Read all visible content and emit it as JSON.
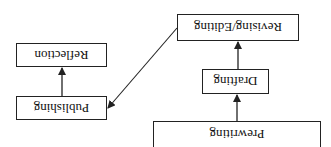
{
  "diagram": {
    "orientation": "rotated-180",
    "nodes": [
      {
        "id": "prewriting",
        "label": "Prewriting",
        "x": 153,
        "y": 121,
        "w": 168,
        "h": 27
      },
      {
        "id": "drafting",
        "label": "Drafting",
        "x": 202,
        "y": 69,
        "w": 67,
        "h": 25
      },
      {
        "id": "revising",
        "label": "Revising/Editing",
        "x": 177,
        "y": 14,
        "w": 122,
        "h": 27
      },
      {
        "id": "publishing",
        "label": "Publishing",
        "x": 16,
        "y": 96,
        "w": 91,
        "h": 24
      },
      {
        "id": "reflection",
        "label": "Reflection",
        "x": 16,
        "y": 43,
        "w": 91,
        "h": 24
      }
    ],
    "edges": [
      {
        "from": "prewriting",
        "to": "drafting"
      },
      {
        "from": "drafting",
        "to": "revising"
      },
      {
        "from": "revising",
        "to": "publishing"
      },
      {
        "from": "publishing",
        "to": "reflection"
      }
    ],
    "colors": {
      "line": "#222222",
      "background": "#ffffff"
    }
  }
}
